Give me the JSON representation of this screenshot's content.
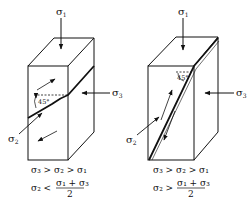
{
  "figure": {
    "type": "stress-fracture-diagram",
    "panels": [
      {
        "id": "left",
        "labels": {
          "sigma1": "σ",
          "sigma1_sub": "1",
          "sigma2": "σ",
          "sigma2_sub": "2",
          "sigma3": "σ",
          "sigma3_sub": "3",
          "angle": "45°"
        },
        "conditions": {
          "line1": "σ₃ > σ₂ > σ₁",
          "line2_lhs": "σ₂ <",
          "line2_num": "σ₁ + σ₃",
          "line2_den": "2"
        }
      },
      {
        "id": "right",
        "labels": {
          "sigma1": "σ",
          "sigma1_sub": "1",
          "sigma2": "σ",
          "sigma2_sub": "2",
          "sigma3": "σ",
          "sigma3_sub": "3",
          "angle": "45°"
        },
        "conditions": {
          "line1": "σ₃ > σ₂ > σ₁",
          "line2_lhs": "σ₂ >",
          "line2_num": "σ₁ + σ₃",
          "line2_den": "2"
        }
      }
    ],
    "colors": {
      "line": "#111111",
      "background": "#ffffff"
    }
  }
}
